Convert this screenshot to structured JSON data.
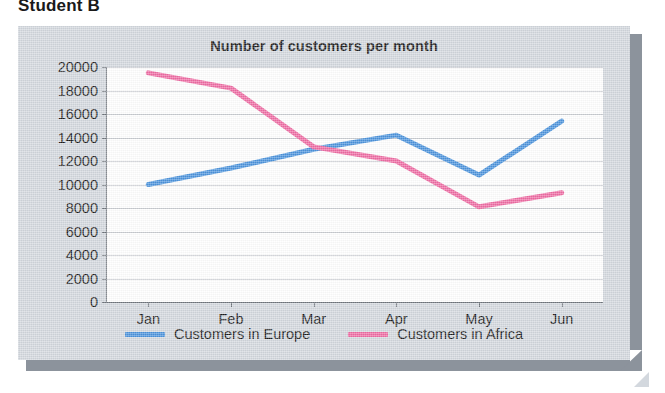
{
  "page": {
    "heading": "Student B"
  },
  "colors": {
    "europe": "#4a93dd",
    "africa": "#ef6ba3",
    "panel_background": "#d3d8de",
    "plot_background": "#ffffff",
    "axis": "#6f757c",
    "gridline": "#c9ccd1",
    "shadow": "#8c939c",
    "text": "#1b1b1b"
  },
  "chart_data": {
    "type": "line",
    "title": "Number of customers per month",
    "xlabel": "",
    "ylabel": "",
    "categories": [
      "Jan",
      "Feb",
      "Mar",
      "Apr",
      "May",
      "Jun"
    ],
    "ylim": [
      0,
      20000
    ],
    "ytick_step": 2000,
    "yticks": [
      20000,
      18000,
      16000,
      14000,
      12000,
      10000,
      8000,
      6000,
      4000,
      2000,
      0
    ],
    "ytick_labels": [
      "20000",
      "18000",
      "16000",
      "14000",
      "12000",
      "10000",
      "8000",
      "6000",
      "4000",
      "2000",
      "0"
    ],
    "grid": true,
    "legend_position": "bottom",
    "series": [
      {
        "name": "Customers in Europe",
        "color": "#4a93dd",
        "values": [
          10000,
          11400,
          13000,
          14200,
          10800,
          15400
        ]
      },
      {
        "name": "Customers in Africa",
        "color": "#ef6ba3",
        "values": [
          19500,
          18200,
          13200,
          12000,
          8100,
          9300
        ]
      }
    ]
  }
}
